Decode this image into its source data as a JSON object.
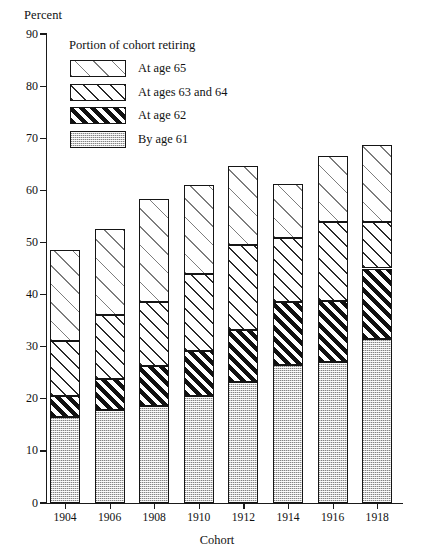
{
  "chart_data": {
    "type": "bar",
    "subtype": "stacked-bar",
    "title": "",
    "xlabel": "Cohort",
    "ylabel": "Percent",
    "ylim": [
      0,
      90
    ],
    "ytick_step": 10,
    "yticks": [
      0,
      10,
      20,
      30,
      40,
      50,
      60,
      70,
      80,
      90
    ],
    "grid": false,
    "legend_position": "upper-left-inside",
    "legend_title": "Portion of cohort retiring",
    "categories": [
      "1904",
      "1906",
      "1908",
      "1910",
      "1912",
      "1914",
      "1916",
      "1918"
    ],
    "series": [
      {
        "name": "By age 61",
        "pattern": "stipple-grey",
        "color": "#cfcfcf",
        "values": [
          16.5,
          17.8,
          18.6,
          20.5,
          23.3,
          26.5,
          27.0,
          31.4
        ]
      },
      {
        "name": "At age 62",
        "pattern": "bold-diagonal-black",
        "color": "#111111",
        "values": [
          4.1,
          6.0,
          7.6,
          8.7,
          9.9,
          12.0,
          11.7,
          13.6
        ]
      },
      {
        "name": "At ages 63 and 64",
        "pattern": "medium-diagonal",
        "color": "#2a2a2a",
        "values": [
          10.4,
          12.2,
          12.3,
          14.8,
          16.3,
          12.3,
          15.3,
          9.0
        ]
      },
      {
        "name": "At age 65",
        "pattern": "sparse-dashes",
        "color": "#7d7d7d",
        "values": [
          17.5,
          16.5,
          19.8,
          17.0,
          15.2,
          10.4,
          12.5,
          14.7
        ]
      }
    ],
    "cumulative_tops": {
      "by_age_61": [
        16.5,
        17.8,
        18.6,
        20.5,
        23.3,
        26.5,
        27.0,
        31.4
      ],
      "at_age_62": [
        20.6,
        23.8,
        26.2,
        29.2,
        33.2,
        38.5,
        38.7,
        45.0
      ],
      "at_ages_63_64": [
        31.0,
        36.0,
        38.5,
        44.0,
        49.5,
        50.8,
        54.0,
        54.0
      ],
      "at_age_65_total": [
        48.5,
        52.5,
        58.3,
        61.0,
        64.7,
        61.2,
        66.5,
        68.7
      ]
    },
    "totals": [
      48.5,
      52.5,
      58.3,
      61.0,
      64.7,
      61.2,
      66.5,
      68.7
    ]
  },
  "legend": {
    "title": "Portion of cohort retiring",
    "items": [
      {
        "label": "At age 65"
      },
      {
        "label": "At ages 63 and 64"
      },
      {
        "label": "At age 62"
      },
      {
        "label": "By age 61"
      }
    ]
  },
  "axes": {
    "y_title": "Percent",
    "x_title": "Cohort",
    "y_tick_labels": [
      "90",
      "80",
      "70",
      "60",
      "50",
      "40",
      "30",
      "20",
      "10",
      "0"
    ],
    "x_tick_labels": [
      "1904",
      "1906",
      "1908",
      "1910",
      "1912",
      "1914",
      "1916",
      "1918"
    ]
  }
}
